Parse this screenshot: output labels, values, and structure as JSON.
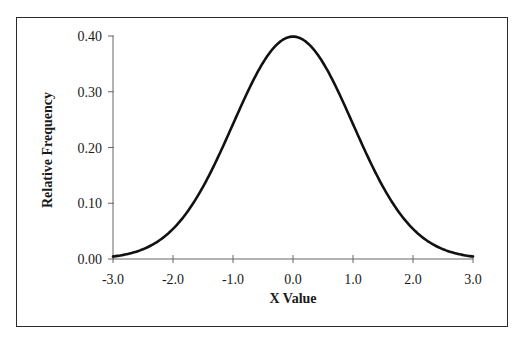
{
  "page": {
    "cutoff_text": "...bell-shaped frequency..."
  },
  "chart_data": {
    "type": "line",
    "title": "",
    "xlabel": "X Value",
    "ylabel": "Relative Frequency",
    "xlim": [
      -3.0,
      3.0
    ],
    "ylim": [
      0.0,
      0.4
    ],
    "x_ticks": [
      "-3.0",
      "-2.0",
      "-1.0",
      "0.0",
      "1.0",
      "2.0",
      "3.0"
    ],
    "y_ticks": [
      "0.00",
      "0.10",
      "0.20",
      "0.30",
      "0.40"
    ],
    "grid": false,
    "legend": null,
    "series": [
      {
        "name": "Standard normal density",
        "x": [
          -3.0,
          -2.5,
          -2.0,
          -1.5,
          -1.0,
          -0.5,
          0.0,
          0.5,
          1.0,
          1.5,
          2.0,
          2.5,
          3.0
        ],
        "values": [
          0.004,
          0.018,
          0.054,
          0.13,
          0.242,
          0.352,
          0.399,
          0.352,
          0.242,
          0.13,
          0.054,
          0.018,
          0.004
        ]
      }
    ]
  }
}
